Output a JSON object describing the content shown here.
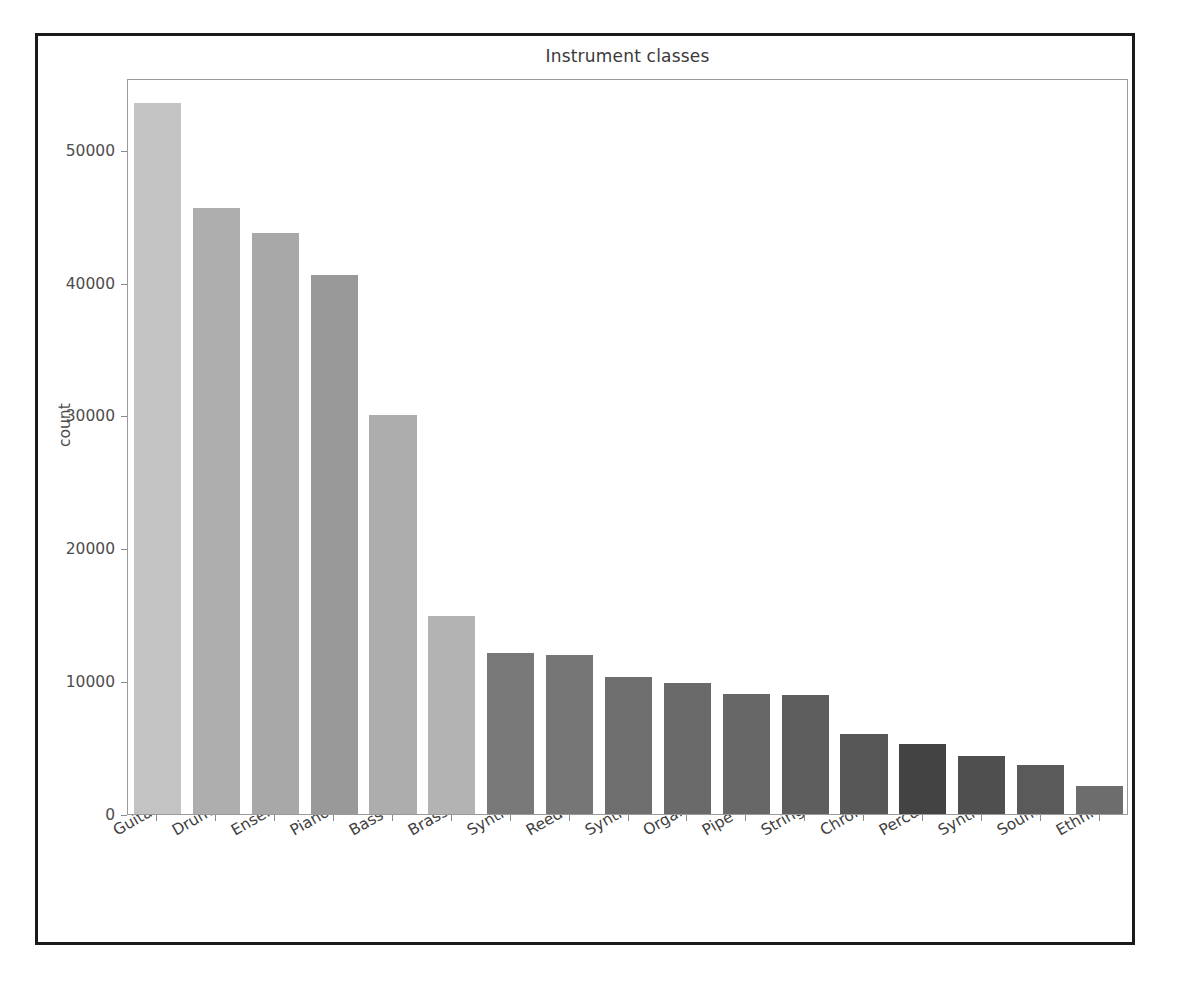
{
  "figure": {
    "background_color": "#ffffff",
    "frame_color": "#1a1a1a",
    "axes_edge_color": "#9a9a9a"
  },
  "chart_data": {
    "type": "bar",
    "title": "Instrument classes",
    "xlabel": "",
    "ylabel": "count",
    "grid": false,
    "legend": "none",
    "ylim": [
      0,
      55400
    ],
    "yticks": [
      0,
      10000,
      20000,
      30000,
      40000,
      50000
    ],
    "ytick_labels": [
      "0",
      "10000",
      "20000",
      "30000",
      "40000",
      "50000"
    ],
    "categories": [
      "Guitar",
      "Drums",
      "Ensemble",
      "Piano",
      "Bass",
      "Brass",
      "Synth Lead",
      "Reed",
      "Synth Pad",
      "Organ",
      "Pipe",
      "Strings",
      "Chromatic Percussion",
      "Percussive",
      "Synth Effects",
      "Sound Effects",
      "Ethnic"
    ],
    "values": [
      53500,
      45600,
      43700,
      40600,
      30000,
      14900,
      12150,
      11950,
      10300,
      9850,
      9050,
      8950,
      6000,
      5300,
      4350,
      3700,
      2100
    ],
    "bar_colors": [
      "#c3c3c3",
      "#aeaeae",
      "#a8a8a8",
      "#999999",
      "#adadad",
      "#b3b3b3",
      "#787878",
      "#767676",
      "#6e6e6e",
      "#6a6a6a",
      "#676767",
      "#5e5e5e",
      "#575757",
      "#434343",
      "#4f4f4f",
      "#5a5a5a",
      "#6d6d6d"
    ]
  }
}
